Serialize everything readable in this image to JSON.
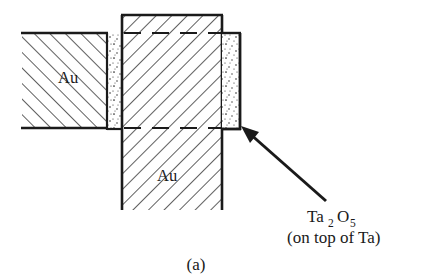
{
  "figure": {
    "caption": "(a)",
    "background_color": "#ffffff",
    "ink_color": "#1a1a1a",
    "materials": {
      "gold_label": "Au",
      "oxide_formula_base1": "Ta",
      "oxide_formula_sub1": "2",
      "oxide_formula_base2": "O",
      "oxide_formula_sub2": "5",
      "oxide_note": "(on top of Ta)"
    },
    "labels": {
      "au_upper": "Au",
      "au_lower": "Au"
    },
    "regions": [
      {
        "name": "left-gold-block",
        "material": "Au",
        "hatch": "diagonal-up-right",
        "x": 22,
        "y": 33,
        "width": 85,
        "height": 95
      },
      {
        "name": "left-oxide-strip",
        "material": "Ta2O5",
        "fill": "stipple",
        "x": 107,
        "y": 33,
        "width": 15,
        "height": 97
      },
      {
        "name": "vertical-gold-column",
        "material": "Au",
        "hatch": "diagonal-down-right",
        "x": 122,
        "y": 15,
        "width": 100,
        "height": 195
      },
      {
        "name": "right-oxide-strip",
        "material": "Ta2O5",
        "fill": "stipple",
        "x": 222,
        "y": 33,
        "width": 18,
        "height": 97
      }
    ],
    "dashed_lines": [
      {
        "name": "upper-interface",
        "x1": 122,
        "y1": 33,
        "x2": 222,
        "y2": 33
      },
      {
        "name": "lower-interface",
        "x1": 122,
        "y1": 128,
        "x2": 222,
        "y2": 128
      }
    ],
    "annotation_arrow": {
      "name": "oxide-callout-arrow",
      "from_x": 326,
      "from_y": 201,
      "to_x": 243,
      "to_y": 128
    }
  }
}
